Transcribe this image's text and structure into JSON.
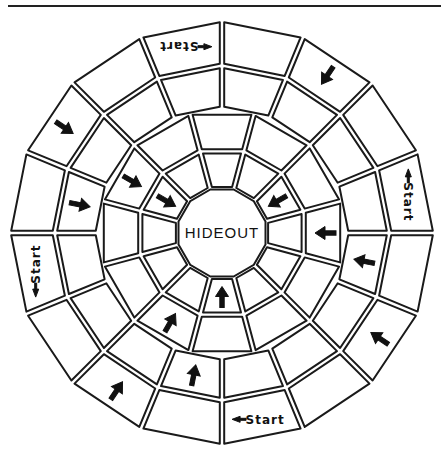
{
  "board": {
    "title": "HIDEOUT",
    "center": [
      222,
      233
    ],
    "colors": {
      "ink": "#1a1a1a",
      "paper": "#ffffff"
    },
    "rings": [
      {
        "id": "hub",
        "r_outer": 45,
        "sides": 12
      },
      {
        "id": "ring1",
        "r_inner": 45,
        "r_outer": 84,
        "cells": 12,
        "offset_deg": -105
      },
      {
        "id": "ring2",
        "r_inner": 84,
        "r_outer": 124,
        "cells": 12,
        "offset_deg": -105
      },
      {
        "id": "ring3",
        "r_inner": 124,
        "r_outer": 167,
        "cells": 16,
        "offset_deg": -90
      },
      {
        "id": "ring4",
        "r_inner": 167,
        "r_outer": 213,
        "cells": 16,
        "offset_deg": -112.5
      }
    ],
    "start_label": "Start",
    "cells": [
      {
        "ring": 1,
        "index": 0,
        "fill": "hatch-light",
        "arrow": null
      },
      {
        "ring": 1,
        "index": 1,
        "fill": "plain",
        "arrow": null
      },
      {
        "ring": 1,
        "index": 2,
        "fill": "plain",
        "arrow": "inward"
      },
      {
        "ring": 1,
        "index": 3,
        "fill": "plain",
        "arrow": null
      },
      {
        "ring": 1,
        "index": 4,
        "fill": "hatch-dense",
        "arrow": null
      },
      {
        "ring": 1,
        "index": 5,
        "fill": "plain",
        "arrow": null
      },
      {
        "ring": 1,
        "index": 6,
        "fill": "plain",
        "arrow": "inward"
      },
      {
        "ring": 1,
        "index": 7,
        "fill": "hatch-light",
        "arrow": null
      },
      {
        "ring": 1,
        "index": 8,
        "fill": "plain",
        "arrow": null
      },
      {
        "ring": 1,
        "index": 9,
        "fill": "plain",
        "arrow": null
      },
      {
        "ring": 1,
        "index": 10,
        "fill": "plain",
        "arrow": "inward"
      },
      {
        "ring": 1,
        "index": 11,
        "fill": "plain",
        "arrow": null
      },
      {
        "ring": 2,
        "index": 0,
        "fill": "plain",
        "arrow": null
      },
      {
        "ring": 2,
        "index": 1,
        "fill": "hatch-dense",
        "arrow": null
      },
      {
        "ring": 2,
        "index": 2,
        "fill": "plain",
        "arrow": null
      },
      {
        "ring": 2,
        "index": 3,
        "fill": "plain",
        "arrow": "inward"
      },
      {
        "ring": 2,
        "index": 4,
        "fill": "plain",
        "arrow": null
      },
      {
        "ring": 2,
        "index": 5,
        "fill": "hatch-dense",
        "arrow": null
      },
      {
        "ring": 2,
        "index": 6,
        "fill": "plain",
        "arrow": null
      },
      {
        "ring": 2,
        "index": 7,
        "fill": "plain",
        "arrow": "inward"
      },
      {
        "ring": 2,
        "index": 8,
        "fill": "plain",
        "arrow": null
      },
      {
        "ring": 2,
        "index": 9,
        "fill": "plain",
        "arrow": null
      },
      {
        "ring": 2,
        "index": 10,
        "fill": "plain",
        "arrow": "inward"
      },
      {
        "ring": 2,
        "index": 11,
        "fill": "plain",
        "arrow": null
      },
      {
        "ring": 3,
        "index": 0,
        "fill": "hatch-light",
        "arrow": null
      },
      {
        "ring": 3,
        "index": 1,
        "fill": "plain",
        "arrow": null
      },
      {
        "ring": 3,
        "index": 2,
        "fill": "plain",
        "arrow": null
      },
      {
        "ring": 3,
        "index": 3,
        "fill": "plain",
        "arrow": null
      },
      {
        "ring": 3,
        "index": 4,
        "fill": "plain",
        "arrow": "inward"
      },
      {
        "ring": 3,
        "index": 5,
        "fill": "plain",
        "arrow": null
      },
      {
        "ring": 3,
        "index": 6,
        "fill": "plain",
        "arrow": null
      },
      {
        "ring": 3,
        "index": 7,
        "fill": "plain",
        "arrow": null
      },
      {
        "ring": 3,
        "index": 8,
        "fill": "plain",
        "arrow": "inward"
      },
      {
        "ring": 3,
        "index": 9,
        "fill": "plain",
        "arrow": null
      },
      {
        "ring": 3,
        "index": 10,
        "fill": "plain",
        "arrow": null
      },
      {
        "ring": 3,
        "index": 11,
        "fill": "hatch-light",
        "arrow": null
      },
      {
        "ring": 3,
        "index": 12,
        "fill": "plain",
        "arrow": "inward"
      },
      {
        "ring": 3,
        "index": 13,
        "fill": "plain",
        "arrow": null
      },
      {
        "ring": 3,
        "index": 14,
        "fill": "plain",
        "arrow": null
      },
      {
        "ring": 3,
        "index": 15,
        "fill": "plain",
        "arrow": null
      },
      {
        "ring": 4,
        "index": 0,
        "fill": "plain",
        "label": "Start",
        "label_rot": 180,
        "arrow": null
      },
      {
        "ring": 4,
        "index": 1,
        "fill": "plain",
        "arrow": null
      },
      {
        "ring": 4,
        "index": 2,
        "fill": "plain",
        "arrow": "inward"
      },
      {
        "ring": 4,
        "index": 3,
        "fill": "plain",
        "arrow": null
      },
      {
        "ring": 4,
        "index": 4,
        "fill": "plain",
        "label": "Start",
        "label_rot": 90,
        "arrow": null
      },
      {
        "ring": 4,
        "index": 5,
        "fill": "plain",
        "arrow": null
      },
      {
        "ring": 4,
        "index": 6,
        "fill": "plain",
        "arrow": "inward"
      },
      {
        "ring": 4,
        "index": 7,
        "fill": "hatch-dense",
        "arrow": null
      },
      {
        "ring": 4,
        "index": 8,
        "fill": "plain",
        "label": "Start",
        "label_rot": 0,
        "arrow": null
      },
      {
        "ring": 4,
        "index": 9,
        "fill": "plain",
        "arrow": null
      },
      {
        "ring": 4,
        "index": 10,
        "fill": "plain",
        "arrow": "inward"
      },
      {
        "ring": 4,
        "index": 11,
        "fill": "hatch-light",
        "arrow": null
      },
      {
        "ring": 4,
        "index": 12,
        "fill": "plain",
        "label": "Start",
        "label_rot": -90,
        "arrow": null
      },
      {
        "ring": 4,
        "index": 13,
        "fill": "plain",
        "arrow": null
      },
      {
        "ring": 4,
        "index": 14,
        "fill": "plain",
        "arrow": "inward"
      },
      {
        "ring": 4,
        "index": 15,
        "fill": "plain",
        "arrow": null
      }
    ]
  }
}
